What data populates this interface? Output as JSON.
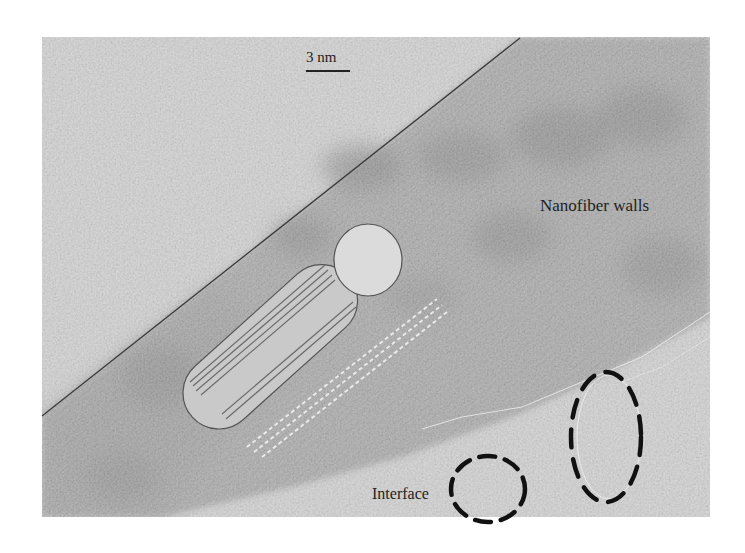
{
  "figure": {
    "type": "TEM micrograph with schematic overlay",
    "scale_bar": {
      "label": "3 nm"
    },
    "annotations": {
      "nanofiber_walls": "Nanofiber walls",
      "interface": "Interface"
    },
    "overlay_elements": [
      "diagonal-boundary-line",
      "nanotube-cylinder-schematic",
      "interface-dashed-circle",
      "interface-dashed-ellipse"
    ],
    "colors": {
      "background_light": "#d2d2d2",
      "fiber_band": "#a8a8a8",
      "fiber_dark_spots": "#8e8e8e",
      "cylinder_fill": "#c8c8c8",
      "cylinder_cap": "#dadada",
      "outline": "#444444",
      "dash": "#111111"
    }
  }
}
